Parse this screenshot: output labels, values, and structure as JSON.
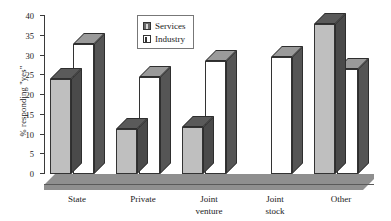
{
  "chart_data": {
    "type": "bar",
    "title": "",
    "xlabel": "",
    "ylabel": "% responding \"yes\"",
    "categories": [
      "State",
      "Private",
      "Joint venture",
      "Joint stock",
      "Other"
    ],
    "series": [
      {
        "name": "Services",
        "values": [
          24,
          11.5,
          12,
          0,
          38
        ]
      },
      {
        "name": "Industry",
        "values": [
          33,
          24.5,
          28.5,
          29.5,
          26.5
        ]
      }
    ],
    "ylim": [
      0,
      40
    ],
    "ytick_step": 5,
    "yticks": [
      "0",
      "5",
      "10",
      "15",
      "20",
      "25",
      "30",
      "35",
      "40"
    ],
    "grid": false,
    "legend_position": "top-center",
    "style": "3d-column",
    "colors": {
      "services_face": "#bfbfbf",
      "services_side": "#4a4a4a",
      "industry_face": "#ffffff",
      "industry_side": "#555555",
      "axis": "#3a3a3a",
      "floor": "#8f8f8f"
    }
  },
  "legend": {
    "items": [
      {
        "label": "Services",
        "swatch": "services-swatch"
      },
      {
        "label": "Industry",
        "swatch": "industry-swatch"
      }
    ]
  },
  "axis": {
    "y_label": "% responding \"yes\"",
    "y_tick_labels": [
      "40",
      "35",
      "30",
      "25",
      "20",
      "15",
      "10",
      "5",
      "0"
    ]
  },
  "category_labels": [
    {
      "line1": "State",
      "line2": ""
    },
    {
      "line1": "Private",
      "line2": ""
    },
    {
      "line1": "Joint",
      "line2": "venture"
    },
    {
      "line1": "Joint",
      "line2": "stock"
    },
    {
      "line1": "Other",
      "line2": ""
    }
  ]
}
